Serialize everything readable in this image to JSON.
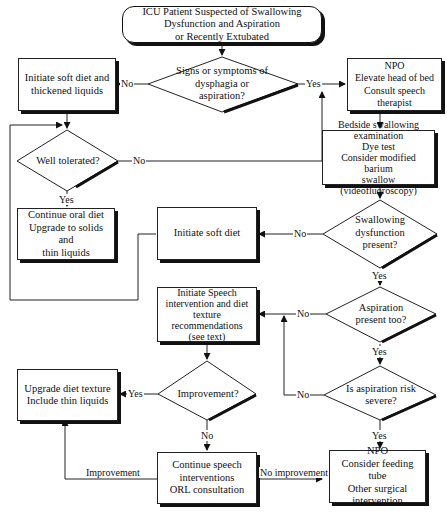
{
  "diagram": {
    "start": "ICU Patient Suspected of Swallowing\nDysfunction and Aspiration\nor Recently Extubated",
    "nodes": {
      "signs": "Signs or symptoms of\ndysphagia or\naspiration?",
      "soft_thick": "Initiate soft diet and\nthickened liquids",
      "npo1": "NPO\nElevate head of bed\nConsult speech therapist",
      "well_tolerated": "Well tolerated?",
      "continue_oral": "Continue oral diet\nUpgrade to solids and\nthin liquids",
      "bedside": "Bedside swallowing\nexamination\nDye test\nConsider modified barium\nswallow (videofluoroscopy)",
      "swallow_dysf": "Swallowing\ndysfunction\npresent?",
      "soft_diet": "Initiate soft diet",
      "speech": "Initiate Speech\nintervention and diet\ntexture\nrecommendations\n(see text)",
      "aspiration_too": "Aspiration\npresent too?",
      "upgrade": "Upgrade diet texture\nInclude thin liquids",
      "improvement": "Improvement?",
      "risk_severe": "Is aspiration risk\nsevere?",
      "continue_speech": "Continue speech\ninterventions\nORL consultation",
      "npo2": "NPO\nConsider feeding tube\nOther surgical\nintervention"
    },
    "labels": {
      "yes": "Yes",
      "no": "No",
      "improvement": "Improvement",
      "no_improvement": "No improvement"
    }
  }
}
